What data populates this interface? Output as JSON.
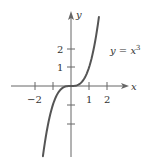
{
  "chart_data": {
    "type": "line",
    "title": "",
    "xlabel": "x",
    "ylabel": "y",
    "annotation": "y = x³",
    "function": "y = x^3",
    "x_ticks": [
      -2,
      -1,
      0,
      1,
      2
    ],
    "x_tick_labels": [
      "−2",
      "",
      "",
      "1",
      "2"
    ],
    "y_ticks": [
      -2,
      -1,
      1,
      2
    ],
    "y_tick_labels": [
      "",
      "",
      "1",
      "2"
    ],
    "xlim": [
      -2,
      2
    ],
    "ylim": [
      -3.8,
      3.7
    ],
    "grid": false,
    "series": [
      {
        "name": "y = x^3",
        "x": [
          -1.56,
          -1.4,
          -1.2,
          -1.0,
          -0.8,
          -0.6,
          -0.4,
          -0.2,
          0,
          0.2,
          0.4,
          0.6,
          0.8,
          1.0,
          1.2,
          1.4,
          1.55
        ],
        "y": [
          -3.8,
          -2.74,
          -1.73,
          -1.0,
          -0.51,
          -0.22,
          -0.06,
          -0.01,
          0,
          0.01,
          0.06,
          0.22,
          0.51,
          1.0,
          1.73,
          2.74,
          3.72
        ]
      }
    ],
    "color": "#555555"
  },
  "labels": {
    "x_axis": "x",
    "y_axis": "y",
    "curve_eq_y": "y",
    "curve_eq_eq": " = ",
    "curve_eq_x": "x",
    "curve_eq_exp": "3",
    "tick_x_neg2": "−2",
    "tick_x_1": "1",
    "tick_x_2": "2",
    "tick_y_1": "1",
    "tick_y_2": "2"
  }
}
